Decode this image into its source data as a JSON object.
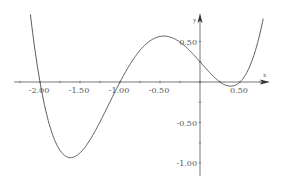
{
  "chart_data": {
    "type": "line",
    "title": "",
    "xlabel": "x",
    "ylabel": "y",
    "xlim": [
      -2.5,
      1.0
    ],
    "ylim": [
      -1.1,
      0.8
    ],
    "grid": false,
    "legend": null,
    "function": "f(x) = (x+2)(x+1)(x-0.25)(x-0.5)",
    "x_ticks": [
      -2.0,
      -1.5,
      -1.0,
      -0.5,
      0.5
    ],
    "x_tick_labels": [
      "-2.00",
      "-1.50",
      "-1.00",
      "-0.50",
      "0.50"
    ],
    "y_ticks": [
      0.5,
      -0.5,
      -1.0
    ],
    "y_tick_labels": [
      "0.50",
      "-0.50",
      "-1.00"
    ],
    "series": [
      {
        "name": "f(x)",
        "x": [
          -2.12,
          -2.0,
          -1.9,
          -1.8,
          -1.7,
          -1.65,
          -1.6,
          -1.5,
          -1.4,
          -1.3,
          -1.2,
          -1.1,
          -1.0,
          -0.9,
          -0.8,
          -0.7,
          -0.6,
          -0.5,
          -0.4,
          -0.3,
          -0.2,
          -0.1,
          0.0,
          0.1,
          0.2,
          0.25,
          0.3,
          0.4,
          0.5,
          0.6,
          0.7,
          0.79
        ],
        "values": [
          0.83,
          0.0,
          -0.4,
          -0.69,
          -0.87,
          -0.92,
          -0.92,
          -0.88,
          -0.79,
          -0.66,
          -0.5,
          -0.26,
          0.0,
          0.14,
          0.32,
          0.45,
          0.53,
          0.56,
          0.55,
          0.5,
          0.42,
          0.32,
          0.25,
          0.13,
          0.03,
          0.0,
          -0.03,
          -0.05,
          0.0,
          0.09,
          0.23,
          0.78
        ]
      }
    ],
    "annotations": [
      {
        "text": "y",
        "position": "top of y-axis"
      },
      {
        "text": "x",
        "position": "right end of x-axis"
      }
    ]
  },
  "axes": {
    "x_name": "x",
    "y_name": "y"
  }
}
